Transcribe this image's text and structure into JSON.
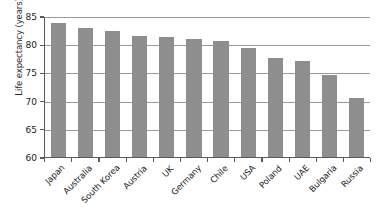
{
  "chart_data": {
    "type": "bar",
    "title": "",
    "xlabel": "",
    "ylabel": "Life expectancy (years)",
    "categories": [
      "Japan",
      "Australia",
      "South Korea",
      "Austria",
      "UK",
      "Germany",
      "Chile",
      "USA",
      "Poland",
      "UAE",
      "Bulgaria",
      "Russia"
    ],
    "values": [
      83.7,
      82.8,
      82.3,
      81.5,
      81.2,
      81.0,
      80.5,
      79.3,
      77.5,
      77.1,
      74.5,
      70.5
    ],
    "ylim": [
      60,
      85
    ],
    "yticks": [
      60,
      65,
      70,
      75,
      80,
      85
    ],
    "ytick_labels": [
      "60",
      "65",
      "70",
      "75",
      "80",
      "85"
    ],
    "grid": "horizontal",
    "legend": "none",
    "bar_color": "#8e8e8e",
    "axis_color": "#5a5a5a",
    "gridline_color": "#9a9a9a",
    "text_color": "#1a1a1a",
    "background_color": "#ffffff"
  }
}
